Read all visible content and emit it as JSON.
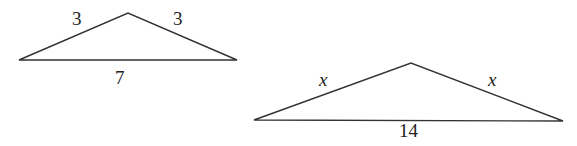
{
  "diagram": {
    "triangles": [
      {
        "name": "small-triangle",
        "points": [
          [
            19,
            60
          ],
          [
            128,
            13
          ],
          [
            237,
            60
          ]
        ],
        "labels": [
          {
            "text": "3",
            "x": 72,
            "y": 25
          },
          {
            "text": "3",
            "x": 173,
            "y": 25
          },
          {
            "text": "7",
            "x": 115,
            "y": 84
          }
        ]
      },
      {
        "name": "large-triangle",
        "points": [
          [
            254,
            120
          ],
          [
            411,
            63
          ],
          [
            563,
            121
          ]
        ],
        "labels": [
          {
            "text": "x",
            "x": 319,
            "y": 86,
            "italic": true
          },
          {
            "text": "x",
            "x": 488,
            "y": 86,
            "italic": true
          },
          {
            "text": "14",
            "x": 399,
            "y": 137
          }
        ]
      }
    ],
    "stroke_color": "#333333"
  }
}
